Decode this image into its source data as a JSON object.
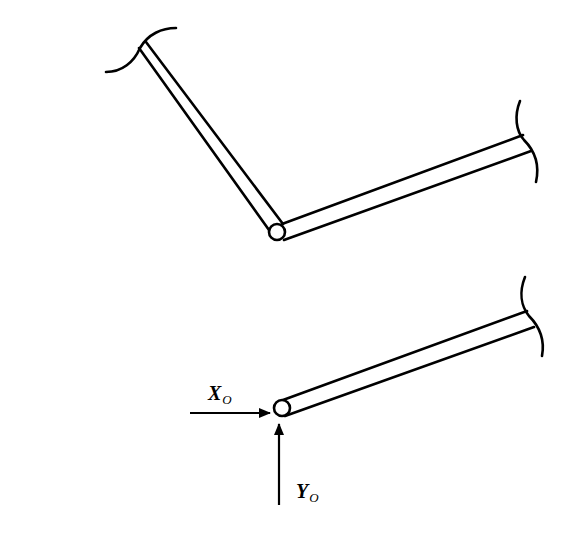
{
  "figure": {
    "background": "#ffffff",
    "stroke_color": "#000000",
    "upper_assembly": {
      "description": "Two-force member bent at a pin joint, both ends broken",
      "members": [
        "inclined-bar",
        "right-bar"
      ],
      "joint": "pin-joint"
    },
    "lower_assembly": {
      "description": "Free body of a single bar with pin reactions at O",
      "members": [
        "bar"
      ],
      "joint": "pin-O"
    },
    "labels": {
      "x_reaction": {
        "main": "X",
        "sub": "O"
      },
      "y_reaction": {
        "main": "Y",
        "sub": "O"
      }
    },
    "icons": {
      "x_arrow": "arrow-right",
      "y_arrow": "arrow-up",
      "break_mark": "break-arc"
    }
  }
}
